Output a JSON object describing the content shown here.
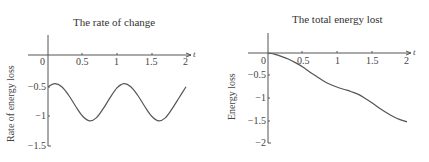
{
  "chart_data": [
    {
      "type": "line",
      "title": "The rate of change",
      "xlabel": "t",
      "ylabel": "Rate of energy loss",
      "x_ticks": [
        "0",
        "0.5",
        "1",
        "1.5",
        "2"
      ],
      "y_ticks": [
        "-0.5",
        "-1",
        "-1.5"
      ],
      "xlim": [
        0,
        2
      ],
      "ylim": [
        -1.5,
        0.3
      ],
      "grid": false,
      "legend": "none",
      "series": [
        {
          "name": "rate",
          "x": [
            0,
            0.1,
            0.2,
            0.3,
            0.4,
            0.5,
            0.6,
            0.7,
            0.8,
            0.9,
            1.0,
            1.1,
            1.2,
            1.3,
            1.4,
            1.5,
            1.6,
            1.7,
            1.8,
            1.9,
            2.0
          ],
          "y": [
            -0.52,
            -0.47,
            -0.52,
            -0.66,
            -0.84,
            -1.0,
            -1.08,
            -1.03,
            -0.88,
            -0.7,
            -0.54,
            -0.47,
            -0.52,
            -0.66,
            -0.84,
            -1.0,
            -1.08,
            -1.03,
            -0.88,
            -0.7,
            -0.52
          ]
        }
      ]
    },
    {
      "type": "line",
      "title": "The total energy lost",
      "xlabel": "t",
      "ylabel": "Energy loss",
      "x_ticks": [
        "0",
        "0.5",
        "1",
        "1.5",
        "2"
      ],
      "y_ticks": [
        "0",
        "-0.5",
        "-1",
        "-1.5",
        "-2"
      ],
      "xlim": [
        0,
        2
      ],
      "ylim": [
        -2,
        0.3
      ],
      "grid": false,
      "legend": "none",
      "series": [
        {
          "name": "energy",
          "x": [
            0,
            0.1,
            0.2,
            0.3,
            0.4,
            0.5,
            0.6,
            0.7,
            0.8,
            0.9,
            1.0,
            1.1,
            1.2,
            1.3,
            1.4,
            1.5,
            1.6,
            1.7,
            1.8,
            1.9,
            2.0
          ],
          "y": [
            0,
            -0.03,
            -0.08,
            -0.14,
            -0.22,
            -0.31,
            -0.42,
            -0.52,
            -0.62,
            -0.7,
            -0.76,
            -0.81,
            -0.86,
            -0.92,
            -1.01,
            -1.11,
            -1.22,
            -1.32,
            -1.41,
            -1.48,
            -1.53
          ]
        }
      ]
    }
  ]
}
